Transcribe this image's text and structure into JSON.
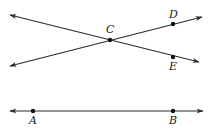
{
  "diagram": {
    "type": "geometry-lines",
    "colors": {
      "line": "#2a2a2a",
      "point": "#111111",
      "background": "#ffffff"
    },
    "points": [
      {
        "id": "C",
        "label": "C",
        "x": 110,
        "y": 40,
        "label_x": 106,
        "label_y": 33
      },
      {
        "id": "D",
        "label": "D",
        "x": 173,
        "y": 24,
        "label_x": 169,
        "label_y": 18
      },
      {
        "id": "E",
        "label": "E",
        "x": 173,
        "y": 57,
        "label_x": 169,
        "label_y": 70
      },
      {
        "id": "A",
        "label": "A",
        "x": 33,
        "y": 111,
        "label_x": 29,
        "label_y": 124
      },
      {
        "id": "B",
        "label": "B",
        "x": 173,
        "y": 111,
        "label_x": 169,
        "label_y": 124
      }
    ],
    "lines": [
      {
        "id": "line-CE",
        "through": [
          "C",
          "E"
        ],
        "x1": 10,
        "y1": 15,
        "x2": 199,
        "y2": 62
      },
      {
        "id": "line-CD",
        "through": [
          "C",
          "D"
        ],
        "x1": 10,
        "y1": 66,
        "x2": 202,
        "y2": 17
      },
      {
        "id": "line-AB",
        "through": [
          "A",
          "B"
        ],
        "x1": 10,
        "y1": 111,
        "x2": 203,
        "y2": 111
      }
    ]
  }
}
